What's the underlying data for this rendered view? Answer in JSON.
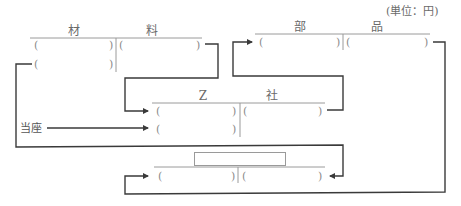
{
  "unit_note": "(単位：円)",
  "accounts": {
    "material": {
      "title_left": "材",
      "title_right": "料"
    },
    "parts": {
      "title_left": "部",
      "title_right": "品"
    },
    "z_company": {
      "title_left": "Z",
      "title_right": "社"
    },
    "unknown": {
      "title_blank": ""
    }
  },
  "paren": {
    "open": "(",
    "close": ")"
  },
  "labels": {
    "current_account": "当座"
  },
  "colors": {
    "line": "#3a3a3a",
    "t_rule": "#9a9a9a",
    "text": "#6a6a6a"
  }
}
